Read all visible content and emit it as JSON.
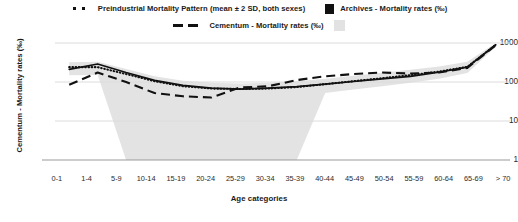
{
  "legend": {
    "rows": [
      {
        "items": [
          {
            "icon": "dotted-line-swatch",
            "label": "Preindustrial Mortality Pattern (mean ± 2 SD, both sexes)"
          },
          {
            "icon": "black-square-swatch",
            "label": "Archives - Mortality rates (‰)"
          }
        ]
      },
      {
        "items": [
          {
            "icon": "dashed-line-swatch",
            "label": "Cementum - Mortality rates (‰)"
          },
          {
            "icon": "grey-band-swatch",
            "label": ""
          }
        ]
      }
    ]
  },
  "axes": {
    "ylabel": "Cementum - Mortality rates (‰)",
    "xlabel": "Age categories",
    "yticks": [
      "1000",
      "100",
      "10",
      "1"
    ]
  },
  "chart_data": {
    "type": "line",
    "title": "",
    "xlabel": "Age categories",
    "ylabel": "Cementum - Mortality rates (‰)",
    "yscale": "log",
    "ylim": [
      1,
      1000
    ],
    "ytick_values": [
      1,
      10,
      100,
      1000
    ],
    "grid": true,
    "legend_position": "top",
    "categories": [
      "0-1",
      "1-4",
      "5-9",
      "10-14",
      "15-19",
      "20-24",
      "25-29",
      "30-34",
      "35-39",
      "40-44",
      "45-49",
      "50-54",
      "55-59",
      "60-64",
      "65-69",
      "> 70"
    ],
    "series": [
      {
        "name": "Preindustrial Mortality Pattern (mean ± 2 SD, both sexes)",
        "style": "dotted",
        "values": [
          240,
          240,
          160,
          105,
          78,
          68,
          66,
          68,
          74,
          88,
          105,
          125,
          150,
          185,
          245,
          900
        ]
      },
      {
        "name": "Archives - Mortality rates (‰)",
        "style": "solid",
        "values": [
          210,
          290,
          175,
          110,
          82,
          70,
          66,
          70,
          76,
          88,
          103,
          120,
          140,
          178,
          240,
          900
        ]
      },
      {
        "name": "Cementum - Mortality rates (‰)",
        "style": "dashed",
        "values": [
          85,
          175,
          100,
          52,
          43,
          40,
          72,
          78,
          112,
          140,
          160,
          175,
          165,
          175,
          230,
          880
        ]
      }
    ],
    "band": {
      "name": "Preindustrial Mortality Pattern ± 2 SD",
      "color": "#e3e3e3",
      "upper": [
        320,
        330,
        215,
        140,
        108,
        95,
        92,
        96,
        104,
        122,
        145,
        172,
        205,
        250,
        330,
        1000
      ],
      "lower": [
        150,
        152,
        1,
        1,
        1,
        1,
        1,
        1,
        1,
        52,
        64,
        78,
        95,
        122,
        170,
        800
      ]
    }
  }
}
